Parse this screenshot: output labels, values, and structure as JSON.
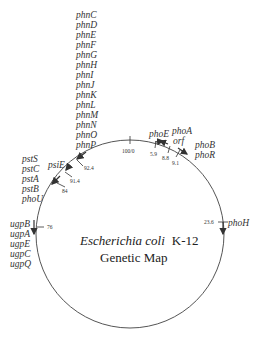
{
  "title": {
    "organism": "Escherichia coli",
    "strain": "K-12",
    "subtitle": "Genetic Map"
  },
  "positions": {
    "p100": "100/0",
    "p5_9": "5.9",
    "p8_8": "8.8",
    "p9_1": "9.1",
    "p23_6": "23.6",
    "p76": "76",
    "p84": "84",
    "p91_4": "91.4",
    "p92_4": "92.4"
  },
  "genes": {
    "phn": [
      "phnC",
      "phnD",
      "phnE",
      "phnF",
      "phnG",
      "phnH",
      "phnI",
      "phnJ",
      "phnK",
      "phnL",
      "phnM",
      "phnN",
      "phnO",
      "phnP"
    ],
    "pst": [
      "pstS",
      "pstC",
      "pstA",
      "pstB",
      "phoU"
    ],
    "psiE": "psiE",
    "ugp": [
      "ugpB",
      "ugpA",
      "ugpE",
      "ugpC",
      "ugpQ"
    ],
    "phoE": "phoE",
    "phoA": "phoA",
    "orf": "orf",
    "phoB": "phoB",
    "phoR": "phoR",
    "phoH": "phoH"
  }
}
